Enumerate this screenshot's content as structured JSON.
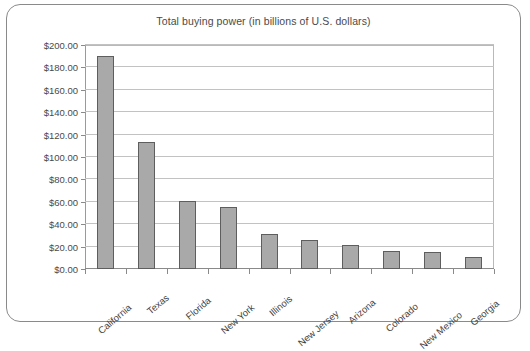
{
  "chart_data": {
    "type": "bar",
    "title": "Total buying power (in billions of U.S. dollars)",
    "xlabel": "",
    "ylabel": "",
    "ylim": [
      0,
      200
    ],
    "ytick_step": 20,
    "ytick_labels": [
      "$0.00",
      "$20.00",
      "$40.00",
      "$60.00",
      "$80.00",
      "$100.00",
      "$120.00",
      "$140.00",
      "$160.00",
      "$180.00",
      "$200.00"
    ],
    "ytick_values": [
      0,
      20,
      40,
      60,
      80,
      100,
      120,
      140,
      160,
      180,
      200
    ],
    "grid": true,
    "legend": "none",
    "categories": [
      "California",
      "Texas",
      "Florida",
      "New York",
      "Illinois",
      "New Jersey",
      "Arizona",
      "Colorado",
      "New Mexico",
      "Georgia"
    ],
    "values": [
      190,
      113,
      61,
      55,
      31,
      26,
      21,
      16,
      15,
      11
    ],
    "bar_color": "#a9a9a9",
    "bar_border_color": "#5e5e5e"
  }
}
